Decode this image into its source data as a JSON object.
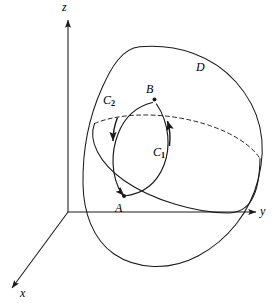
{
  "figure": {
    "type": "math-diagram-3d",
    "background_color": "#ffffff",
    "stroke_color": "#1a1a1a",
    "axes": {
      "origin": {
        "x": 68,
        "y": 212
      },
      "labels": {
        "z": "z",
        "y": "y",
        "x": "x"
      }
    },
    "points": [
      {
        "name": "A",
        "label": "A",
        "x": 124,
        "y": 196
      },
      {
        "name": "B",
        "label": "B",
        "x": 154,
        "y": 99
      }
    ],
    "curves": [
      {
        "name": "C1",
        "label_base": "C",
        "label_sub": "1",
        "orientation": "upward from A to B along the right arc",
        "arrow_direction": "up-right"
      },
      {
        "name": "C2",
        "label_base": "C",
        "label_sub": "2",
        "orientation": "downward from B to A along the left arc",
        "arrow_direction": "down-left"
      }
    ],
    "regions": [
      {
        "name": "D",
        "label": "D",
        "description": "egg-shaped closed surface"
      }
    ],
    "ellipse": {
      "front_arc_style": "solid",
      "back_arc_style": "dashed"
    }
  }
}
